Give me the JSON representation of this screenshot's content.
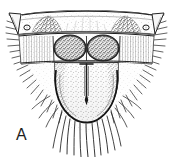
{
  "figure": {
    "panel_label": "A",
    "caption_text": "",
    "illustration_style": "stippled ink line drawing",
    "background_color": "#ffffff",
    "ink_color": "#1d1d1d",
    "mid_tone_color": "#6e6e6e",
    "light_tone_color": "#b8b8b8",
    "dimensions": {
      "width": 173,
      "height": 157
    },
    "structures": [
      {
        "name": "outer-margin",
        "label": "body outline",
        "description": "trapezoidal shield outline, broad arched dorsal margin narrowing to a rounded ventral apex"
      },
      {
        "name": "anterior-transverse-band",
        "label": "anterior band",
        "description": "arched transverse sclerite band spanning the full width with acute lateral corner points"
      },
      {
        "name": "lateral-corner-point-left",
        "label": "left lateral point",
        "description": "acute triangular projection at upper left corner"
      },
      {
        "name": "lateral-corner-point-right",
        "label": "right lateral point",
        "description": "acute triangular projection at upper right corner"
      },
      {
        "name": "anterior-dark-patch-left",
        "label": "left anterior patch",
        "description": "dark stippled triangular patch inside anterior band, left of midline"
      },
      {
        "name": "anterior-dark-patch-right",
        "label": "right anterior patch",
        "description": "dark stippled triangular patch inside anterior band, right of midline"
      },
      {
        "name": "pore-left",
        "label": "left pore",
        "description": "small circular pore near the left outer end of the anterior band"
      },
      {
        "name": "pore-right",
        "label": "right pore",
        "description": "small circular pore near the right outer end of the anterior band"
      },
      {
        "name": "median-lobe-left",
        "label": "left median lobe",
        "description": "rounded, densely stippled dark lobe left of the midline in the middle band"
      },
      {
        "name": "median-lobe-right",
        "label": "right median lobe",
        "description": "rounded, densely stippled dark lobe right of the midline in the middle band"
      },
      {
        "name": "lateral-hatch-left",
        "label": "left lateral field",
        "description": "hatched lateral field flanking the left median lobe"
      },
      {
        "name": "lateral-hatch-right",
        "label": "right lateral field",
        "description": "hatched lateral field flanking the right median lobe"
      },
      {
        "name": "subgenital-plate",
        "label": "subgenital plate",
        "description": "large rounded U-shaped stippled plate occupying the ventral half"
      },
      {
        "name": "median-groove",
        "label": "median groove",
        "description": "narrow vertical slit with T-shaped anterior end, tapering to a point posteriorly"
      },
      {
        "name": "setal-fringe-ventral",
        "label": "ventral setal fringe",
        "description": "long curved setae radiating downward from the posterior margin"
      },
      {
        "name": "setal-fringe-left",
        "label": "left marginal setae",
        "description": "row of short setae along the left lateral margin"
      },
      {
        "name": "setal-fringe-right",
        "label": "right marginal setae",
        "description": "row of short setae along the right lateral margin"
      }
    ]
  }
}
